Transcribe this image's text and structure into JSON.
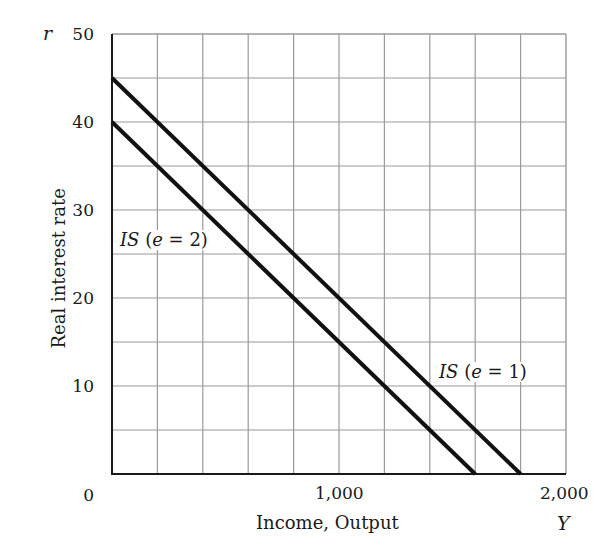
{
  "chart_data": {
    "type": "line",
    "title": "",
    "xlabel": "Income, Output",
    "xlabel_symbol": "Y",
    "ylabel": "Real interest rate",
    "ylabel_symbol": "r",
    "xlim": [
      0,
      2000
    ],
    "ylim": [
      0,
      50
    ],
    "x_ticks": [
      0,
      1000,
      2000
    ],
    "x_tick_labels": [
      "0",
      "1,000",
      "2,000"
    ],
    "y_ticks": [
      0,
      10,
      20,
      30,
      40,
      50
    ],
    "y_tick_labels": [
      "0",
      "10",
      "20",
      "30",
      "40",
      "50"
    ],
    "grid": true,
    "grid_x_step": 200,
    "grid_y_step": 5,
    "legend": "inline labels",
    "series": [
      {
        "name": "IS (e = 1)",
        "label_prefix": "IS",
        "label_var": "e",
        "label_value": "1",
        "x": [
          0,
          1800
        ],
        "y": [
          45,
          0
        ],
        "color": "#111111"
      },
      {
        "name": "IS (e = 2)",
        "label_prefix": "IS",
        "label_var": "e",
        "label_value": "2",
        "x": [
          0,
          1600
        ],
        "y": [
          40,
          0
        ],
        "color": "#111111"
      }
    ]
  },
  "labels": {
    "r": "r",
    "Y": "Y",
    "xlabel": "Income, Output",
    "ylabel": "Real interest rate",
    "y50": "50",
    "y40": "40",
    "y30": "30",
    "y20": "20",
    "y10": "10",
    "y0": "0",
    "x1000": "1,000",
    "x2000": "2,000",
    "is1_prefix": "IS",
    "is1_open": " (",
    "is1_var": "e",
    "is1_rest": " = 1)",
    "is2_prefix": "IS",
    "is2_open": " (",
    "is2_var": "e",
    "is2_rest": " = 2)"
  },
  "colors": {
    "grid": "#9a9a9a",
    "axis": "#1a1a1a",
    "line": "#111111",
    "background": "#ffffff"
  }
}
